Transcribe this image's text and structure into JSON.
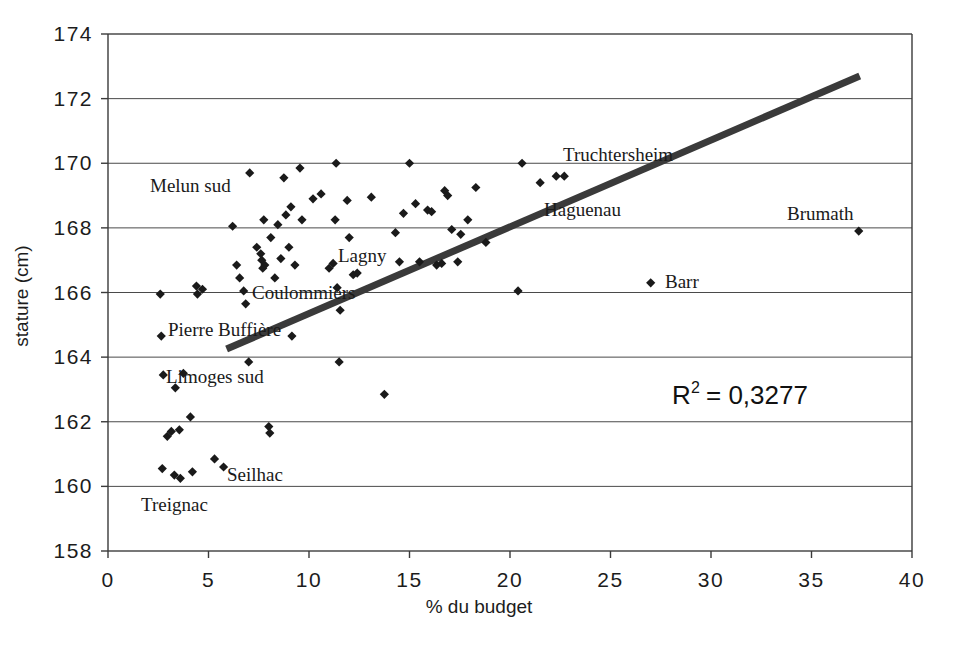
{
  "chart_data": {
    "type": "scatter",
    "title": "",
    "xlabel": "% du budget",
    "ylabel": "stature  (cm)",
    "xlim": [
      0,
      40
    ],
    "ylim": [
      158,
      174
    ],
    "xticks": [
      "0",
      "5",
      "10",
      "15",
      "20",
      "25",
      "30",
      "35",
      "40"
    ],
    "yticks": [
      "158",
      "160",
      "162",
      "164",
      "166",
      "168",
      "170",
      "172",
      "174"
    ],
    "grid": "horizontal",
    "legend": "none",
    "annotation_r2_label": "R",
    "annotation_r2_exponent": "2",
    "annotation_r2_value": "= 0,3277",
    "trendline": {
      "type": "linear",
      "x_start": 5.9,
      "y_start": 164.25,
      "x_end": 37.4,
      "y_end": 172.7,
      "color": "#3a3a3a",
      "width": 7
    },
    "point_color": "#1a1a1a",
    "marker": "diamond",
    "marker_size": 7,
    "points": [
      {
        "x": 2.65,
        "y": 164.65
      },
      {
        "x": 2.6,
        "y": 165.95
      },
      {
        "x": 2.75,
        "y": 163.45
      },
      {
        "x": 2.7,
        "y": 160.55
      },
      {
        "x": 2.95,
        "y": 161.55
      },
      {
        "x": 3.15,
        "y": 161.7
      },
      {
        "x": 3.35,
        "y": 163.05
      },
      {
        "x": 3.3,
        "y": 160.35
      },
      {
        "x": 3.55,
        "y": 161.75
      },
      {
        "x": 3.6,
        "y": 160.25
      },
      {
        "x": 3.75,
        "y": 163.5
      },
      {
        "x": 4.1,
        "y": 162.15
      },
      {
        "x": 4.2,
        "y": 160.45
      },
      {
        "x": 4.4,
        "y": 166.2
      },
      {
        "x": 4.45,
        "y": 165.95
      },
      {
        "x": 4.7,
        "y": 166.1
      },
      {
        "x": 5.3,
        "y": 160.85
      },
      {
        "x": 5.75,
        "y": 160.6
      },
      {
        "x": 6.2,
        "y": 168.05
      },
      {
        "x": 6.4,
        "y": 166.85
      },
      {
        "x": 6.55,
        "y": 166.45
      },
      {
        "x": 6.75,
        "y": 166.05
      },
      {
        "x": 6.85,
        "y": 165.65
      },
      {
        "x": 7.0,
        "y": 163.85
      },
      {
        "x": 7.05,
        "y": 169.7
      },
      {
        "x": 7.4,
        "y": 167.4
      },
      {
        "x": 7.6,
        "y": 167.2
      },
      {
        "x": 7.65,
        "y": 167.0
      },
      {
        "x": 7.7,
        "y": 166.75
      },
      {
        "x": 7.8,
        "y": 166.85
      },
      {
        "x": 7.75,
        "y": 168.25
      },
      {
        "x": 8.0,
        "y": 161.85
      },
      {
        "x": 8.05,
        "y": 161.65
      },
      {
        "x": 8.1,
        "y": 167.7
      },
      {
        "x": 8.3,
        "y": 166.45
      },
      {
        "x": 8.45,
        "y": 168.1
      },
      {
        "x": 8.6,
        "y": 167.05
      },
      {
        "x": 8.75,
        "y": 169.55
      },
      {
        "x": 8.85,
        "y": 168.4
      },
      {
        "x": 9.1,
        "y": 168.65
      },
      {
        "x": 9.15,
        "y": 164.65
      },
      {
        "x": 9.0,
        "y": 167.4
      },
      {
        "x": 9.3,
        "y": 166.85
      },
      {
        "x": 9.55,
        "y": 169.85
      },
      {
        "x": 9.65,
        "y": 168.25
      },
      {
        "x": 10.2,
        "y": 168.9
      },
      {
        "x": 10.6,
        "y": 169.05
      },
      {
        "x": 11.0,
        "y": 166.75
      },
      {
        "x": 11.2,
        "y": 166.9
      },
      {
        "x": 11.3,
        "y": 168.25
      },
      {
        "x": 11.35,
        "y": 170.0
      },
      {
        "x": 11.4,
        "y": 166.15
      },
      {
        "x": 11.5,
        "y": 163.85
      },
      {
        "x": 11.55,
        "y": 165.45
      },
      {
        "x": 11.9,
        "y": 168.85
      },
      {
        "x": 12.0,
        "y": 167.7
      },
      {
        "x": 12.2,
        "y": 166.55
      },
      {
        "x": 12.4,
        "y": 166.6
      },
      {
        "x": 13.1,
        "y": 168.95
      },
      {
        "x": 13.75,
        "y": 162.85
      },
      {
        "x": 14.3,
        "y": 167.85
      },
      {
        "x": 14.5,
        "y": 166.95
      },
      {
        "x": 14.7,
        "y": 168.45
      },
      {
        "x": 15.0,
        "y": 170.0
      },
      {
        "x": 15.3,
        "y": 168.75
      },
      {
        "x": 15.5,
        "y": 166.95
      },
      {
        "x": 15.9,
        "y": 168.55
      },
      {
        "x": 16.1,
        "y": 168.5
      },
      {
        "x": 16.35,
        "y": 166.85
      },
      {
        "x": 16.6,
        "y": 166.9
      },
      {
        "x": 16.75,
        "y": 169.15
      },
      {
        "x": 16.9,
        "y": 169.0
      },
      {
        "x": 17.1,
        "y": 167.95
      },
      {
        "x": 17.4,
        "y": 166.95
      },
      {
        "x": 17.55,
        "y": 167.8
      },
      {
        "x": 17.9,
        "y": 168.25
      },
      {
        "x": 18.3,
        "y": 169.25
      },
      {
        "x": 18.8,
        "y": 167.55
      },
      {
        "x": 20.4,
        "y": 166.05
      },
      {
        "x": 20.6,
        "y": 170.0
      },
      {
        "x": 21.5,
        "y": 169.4
      },
      {
        "x": 22.3,
        "y": 169.6
      },
      {
        "x": 22.7,
        "y": 169.6
      },
      {
        "x": 27.0,
        "y": 166.3
      },
      {
        "x": 37.35,
        "y": 167.9
      }
    ],
    "annotations": [
      {
        "name": "melun-sud",
        "text": "Melun sud",
        "x": 150,
        "y": 192
      },
      {
        "name": "truchtersheim",
        "text": "Truchtersheim",
        "x": 563,
        "y": 161
      },
      {
        "name": "haguenau",
        "text": "Haguenau",
        "x": 544,
        "y": 216
      },
      {
        "name": "brumath",
        "text": "Brumath",
        "x": 787,
        "y": 220
      },
      {
        "name": "lagny",
        "text": "Lagny",
        "x": 338,
        "y": 262
      },
      {
        "name": "barr",
        "text": "Barr",
        "x": 665,
        "y": 288
      },
      {
        "name": "coulommiers",
        "text": "Coulommiers",
        "x": 252,
        "y": 299
      },
      {
        "name": "pierre-buffiere",
        "text": "Pierre Buffière",
        "x": 168,
        "y": 336
      },
      {
        "name": "limoges-sud",
        "text": "Limoges sud",
        "x": 166,
        "y": 383
      },
      {
        "name": "seilhac",
        "text": "Seilhac",
        "x": 227,
        "y": 481
      },
      {
        "name": "treignac",
        "text": "Treignac",
        "x": 141,
        "y": 511
      }
    ]
  },
  "geometry": {
    "plot_left": 108,
    "plot_right": 912,
    "plot_top": 34,
    "plot_bottom": 551
  }
}
